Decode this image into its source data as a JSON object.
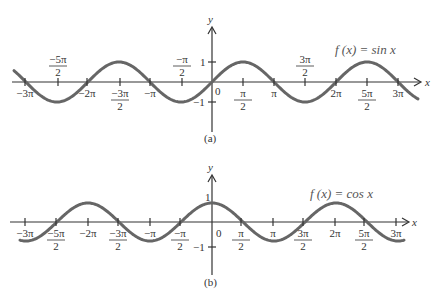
{
  "chart_data": [
    {
      "type": "line",
      "panel": "(a)",
      "title": "f(x) = sin x",
      "xlabel": "x",
      "ylabel": "y",
      "function": "sin",
      "xlim": [
        -9.74,
        9.74
      ],
      "ylim": [
        -1,
        1
      ],
      "x_ticks_below": [
        "-3π",
        "-2π",
        "-3π/2",
        "-π",
        "π/2",
        "π",
        "2π",
        "5π/2",
        "3π"
      ],
      "x_ticks_above": [
        "-5π/2",
        "-π/2",
        "3π/2"
      ],
      "y_ticks": [
        "1",
        "0",
        "-1"
      ],
      "sample_points": [
        [
          -9.42,
          0
        ],
        [
          -7.85,
          -1
        ],
        [
          -6.28,
          0
        ],
        [
          -4.71,
          1
        ],
        [
          -3.14,
          0
        ],
        [
          -1.57,
          -1
        ],
        [
          0,
          0
        ],
        [
          1.57,
          1
        ],
        [
          3.14,
          0
        ],
        [
          4.71,
          -1
        ],
        [
          6.28,
          0
        ],
        [
          7.85,
          1
        ],
        [
          9.42,
          0
        ]
      ]
    },
    {
      "type": "line",
      "panel": "(b)",
      "title": "f(x) = cos x",
      "xlabel": "x",
      "ylabel": "y",
      "function": "cos",
      "xlim": [
        -9.74,
        9.74
      ],
      "ylim": [
        -1,
        1
      ],
      "x_ticks_below": [
        "-3π",
        "-5π/2",
        "-2π",
        "-3π/2",
        "-π",
        "-π/2",
        "π/2",
        "π",
        "3π/2",
        "2π",
        "5π/2",
        "3π"
      ],
      "y_ticks": [
        "1",
        "0",
        "-1"
      ],
      "sample_points": [
        [
          -9.42,
          -1
        ],
        [
          -7.85,
          0
        ],
        [
          -6.28,
          1
        ],
        [
          -4.71,
          0
        ],
        [
          -3.14,
          -1
        ],
        [
          -1.57,
          0
        ],
        [
          0,
          1
        ],
        [
          1.57,
          0
        ],
        [
          3.14,
          -1
        ],
        [
          4.71,
          0
        ],
        [
          6.28,
          1
        ],
        [
          7.85,
          0
        ],
        [
          9.42,
          -1
        ]
      ]
    }
  ],
  "panels": {
    "a": {
      "caption": "(a)",
      "fn_label": "f (x) = sin x",
      "x_axis": "x",
      "y_axis": "y",
      "zero": "0",
      "one": "1",
      "neg_one": "−1",
      "ticks_below": [
        {
          "num": "−3π",
          "den": "",
          "x": 25
        },
        {
          "num": "−2π",
          "den": "",
          "x": 87
        },
        {
          "num": "−3π",
          "den": "2",
          "x": 120
        },
        {
          "num": "−π",
          "den": "",
          "x": 150
        },
        {
          "num": "π",
          "den": "2",
          "x": 243
        },
        {
          "num": "π",
          "den": "",
          "x": 274
        },
        {
          "num": "2π",
          "den": "",
          "x": 336
        },
        {
          "num": "5π",
          "den": "2",
          "x": 367
        },
        {
          "num": "3π",
          "den": "",
          "x": 398
        }
      ],
      "ticks_above": [
        {
          "num": "−5π",
          "den": "2",
          "x": 58
        },
        {
          "num": "−π",
          "den": "2",
          "x": 182
        },
        {
          "num": "3π",
          "den": "2",
          "x": 305
        }
      ]
    },
    "b": {
      "caption": "(b)",
      "fn_label": "f (x) = cos x",
      "x_axis": "x",
      "y_axis": "y",
      "zero": "0",
      "one": "1",
      "neg_one": "−1",
      "ticks_below": [
        {
          "num": "−3π",
          "den": "",
          "x": 25
        },
        {
          "num": "−5π",
          "den": "2",
          "x": 56
        },
        {
          "num": "−2π",
          "den": "",
          "x": 88
        },
        {
          "num": "−3π",
          "den": "2",
          "x": 118
        },
        {
          "num": "−π",
          "den": "",
          "x": 150
        },
        {
          "num": "−π",
          "den": "2",
          "x": 180
        },
        {
          "num": "π",
          "den": "2",
          "x": 241
        },
        {
          "num": "π",
          "den": "",
          "x": 273
        },
        {
          "num": "3π",
          "den": "2",
          "x": 303
        },
        {
          "num": "2π",
          "den": "",
          "x": 335
        },
        {
          "num": "5π",
          "den": "2",
          "x": 364
        },
        {
          "num": "3π",
          "den": "",
          "x": 396
        }
      ]
    }
  },
  "colors": {
    "axis": "#333333",
    "curve": "#666666",
    "label": "#555555"
  }
}
